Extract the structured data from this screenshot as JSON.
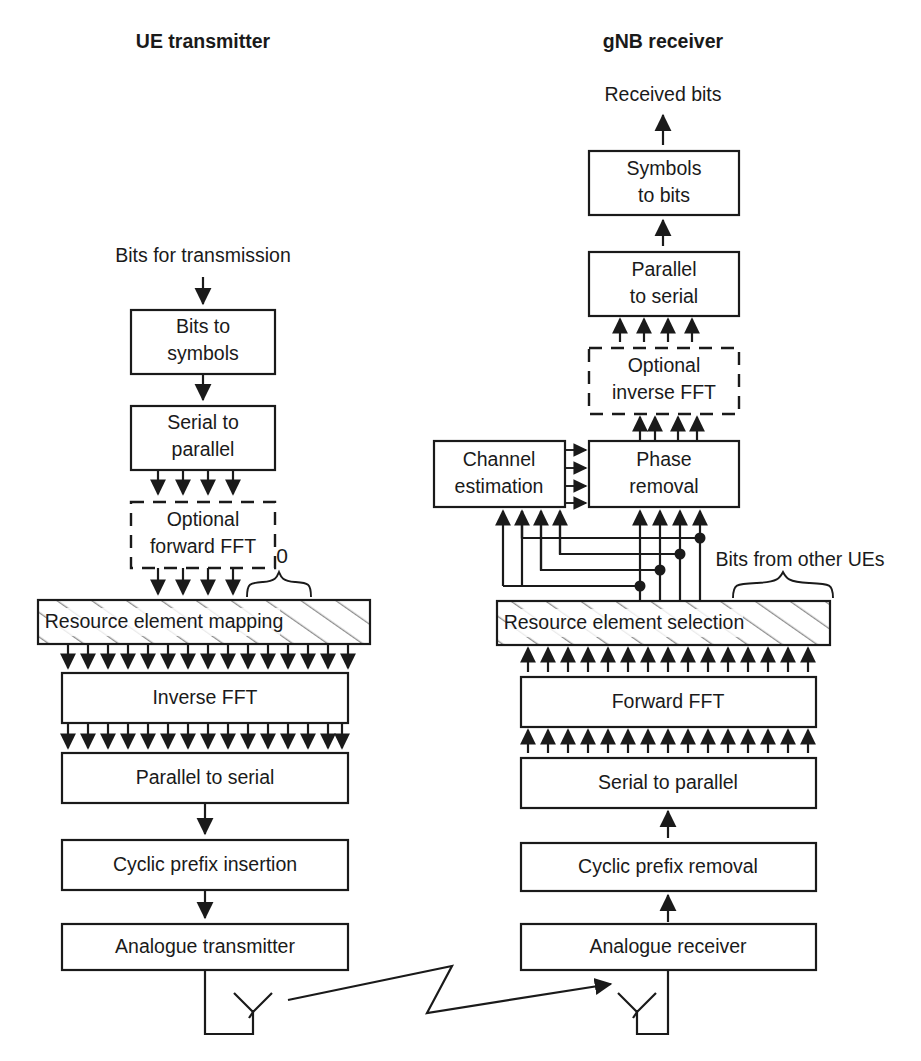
{
  "figure": {
    "background_color": "#ffffff",
    "line_color": "#1a1a1a"
  },
  "columns": {
    "transmitter": {
      "heading": "UE transmitter",
      "input_label": "Bits for transmission",
      "blocks": [
        {
          "id": "bits-to-symbols",
          "label_line1": "Bits to",
          "label_line2": "symbols",
          "style": "solid"
        },
        {
          "id": "serial-to-parallel",
          "label_line1": "Serial to",
          "label_line2": "parallel",
          "style": "solid"
        },
        {
          "id": "optional-forward-fft",
          "label_line1": "Optional",
          "label_line2": "forward FFT",
          "style": "dashed"
        },
        {
          "id": "resource-element-mapping",
          "label_line1": "Resource element mapping",
          "label_line2": "",
          "style": "hatched"
        },
        {
          "id": "inverse-fft",
          "label_line1": "Inverse FFT",
          "label_line2": "",
          "style": "solid"
        },
        {
          "id": "parallel-to-serial",
          "label_line1": "Parallel to serial",
          "label_line2": "",
          "style": "solid"
        },
        {
          "id": "cyclic-prefix-insertion",
          "label_line1": "Cyclic prefix insertion",
          "label_line2": "",
          "style": "solid"
        },
        {
          "id": "analogue-transmitter",
          "label_line1": "Analogue transmitter",
          "label_line2": "",
          "style": "solid"
        }
      ],
      "annotations": [
        {
          "id": "zero-label",
          "text": "0"
        }
      ],
      "antenna_name": "ue-antenna"
    },
    "receiver": {
      "heading": "gNB receiver",
      "output_label": "Received bits",
      "blocks": [
        {
          "id": "symbols-to-bits",
          "label_line1": "Symbols",
          "label_line2": "to bits",
          "style": "solid"
        },
        {
          "id": "parallel-to-serial-rx",
          "label_line1": "Parallel",
          "label_line2": "to serial",
          "style": "solid"
        },
        {
          "id": "optional-inverse-fft",
          "label_line1": "Optional",
          "label_line2": "inverse FFT",
          "style": "dashed"
        },
        {
          "id": "phase-removal",
          "label_line1": "Phase",
          "label_line2": "removal",
          "style": "solid"
        },
        {
          "id": "channel-estimation",
          "label_line1": "Channel",
          "label_line2": "estimation",
          "style": "solid"
        },
        {
          "id": "resource-element-selection",
          "label_line1": "Resource element selection",
          "label_line2": "",
          "style": "hatched"
        },
        {
          "id": "forward-fft",
          "label_line1": "Forward FFT",
          "label_line2": "",
          "style": "solid"
        },
        {
          "id": "serial-to-parallel-rx",
          "label_line1": "Serial to parallel",
          "label_line2": "",
          "style": "solid"
        },
        {
          "id": "cyclic-prefix-removal",
          "label_line1": "Cyclic prefix removal",
          "label_line2": "",
          "style": "solid"
        },
        {
          "id": "analogue-receiver",
          "label_line1": "Analogue receiver",
          "label_line2": "",
          "style": "solid"
        }
      ],
      "annotations": [
        {
          "id": "other-ues-label",
          "text": "Bits from other UEs"
        }
      ],
      "antenna_name": "gnb-antenna"
    }
  },
  "link": {
    "name": "radio-channel-arrow",
    "description": "lightning-bolt arrow from UE antenna to gNB antenna"
  },
  "bus_counts": {
    "narrow_bus_arrows": 4,
    "wide_bus_arrows": 16,
    "channel_estimation_feeds": 4
  }
}
